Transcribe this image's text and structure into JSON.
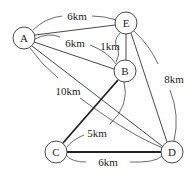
{
  "diagram": {
    "type": "weighted-graph",
    "nodes": [
      {
        "id": "A",
        "label": "A"
      },
      {
        "id": "B",
        "label": "B"
      },
      {
        "id": "C",
        "label": "C"
      },
      {
        "id": "D",
        "label": "D"
      },
      {
        "id": "E",
        "label": "E"
      }
    ],
    "edges": [
      {
        "from": "A",
        "to": "E",
        "label": "6km"
      },
      {
        "from": "A",
        "to": "B",
        "label": "6km"
      },
      {
        "from": "E",
        "to": "B",
        "label": "1km"
      },
      {
        "from": "A",
        "to": "D",
        "label": "10km"
      },
      {
        "from": "E",
        "to": "D",
        "label": "8km"
      },
      {
        "from": "B",
        "to": "C",
        "label": "5km",
        "emphasis": "thick"
      },
      {
        "from": "C",
        "to": "D",
        "label": "6km",
        "emphasis": "thick"
      }
    ]
  },
  "labels": {
    "node_a": "A",
    "node_b": "B",
    "node_c": "C",
    "node_d": "D",
    "node_e": "E",
    "edge_ae": "6km",
    "edge_ab": "6km",
    "edge_eb": "1km",
    "edge_ad": "10km",
    "edge_ed": "8km",
    "edge_bc": "5km",
    "edge_cd": "6km"
  }
}
